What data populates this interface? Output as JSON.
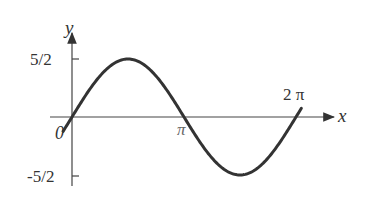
{
  "chart_data": {
    "type": "line",
    "title": "",
    "function": "y = (5/2) sin(x)",
    "xlabel": "x",
    "ylabel": "y",
    "x_ticks": [
      {
        "value": 0,
        "label": "0"
      },
      {
        "value": 3.14159,
        "label": "π"
      },
      {
        "value": 6.28318,
        "label": "2π"
      }
    ],
    "y_ticks": [
      {
        "value": 2.5,
        "label": "5/2"
      },
      {
        "value": -2.5,
        "label": "-5/2"
      }
    ],
    "xlim": [
      0,
      6.6
    ],
    "ylim": [
      -2.5,
      2.5
    ],
    "grid": false,
    "series": [
      {
        "name": "y = 5/2 sin x",
        "x": [
          0,
          0.785,
          1.571,
          2.356,
          3.142,
          3.927,
          4.712,
          5.498,
          6.283
        ],
        "values": [
          0,
          1.77,
          2.5,
          1.77,
          0,
          -1.77,
          -2.5,
          -1.77,
          0
        ]
      }
    ],
    "line_color": "#333333"
  },
  "labels": {
    "y_axis": "y",
    "x_axis": "x",
    "origin": "0",
    "pi": "π",
    "two_pi": "2 π",
    "y_max": "5/2",
    "y_min": "-5/2"
  }
}
